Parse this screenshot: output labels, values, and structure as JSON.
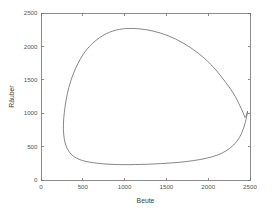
{
  "figure": {
    "background_color": "#ffffff",
    "axes_color": "#6f6f6f",
    "tick_label_color": "#555555",
    "axis_title_color": "#404040",
    "curve_color": "#5e5e5e"
  },
  "chart_data": {
    "type": "line",
    "title": "",
    "subtitle": "",
    "xlabel": "Beute",
    "ylabel": "Räuber",
    "xlim": [
      0,
      2500
    ],
    "ylim": [
      0,
      2500
    ],
    "xticks": [
      0,
      500,
      1000,
      1500,
      2000,
      2500
    ],
    "yticks": [
      0,
      500,
      1000,
      1500,
      2000,
      2500
    ],
    "xtick_labels": [
      "0",
      "500",
      "1000",
      "1500",
      "2000",
      "2500"
    ],
    "ytick_labels": [
      "0",
      "500",
      "1000",
      "1500",
      "2000",
      "2500"
    ],
    "grid": false,
    "legend": null,
    "legend_position": "none",
    "annotations": [],
    "series": [
      {
        "name": "Trajektorie",
        "color": "#5e5e5e",
        "linewidth": 0.75,
        "closed_orbit": true,
        "description": "Geschlossener Grenzzyklus im Phasenraum Beute-Räuber",
        "x": [
          2440,
          2380,
          2300,
          2180,
          2040,
          1880,
          1700,
          1520,
          1340,
          1180,
          1040,
          940,
          860,
          780,
          700,
          620,
          545,
          475,
          410,
          355,
          315,
          288,
          272,
          268,
          278,
          300,
          338,
          390,
          455,
          535,
          630,
          735,
          850,
          980,
          1120,
          1270,
          1430,
          1590,
          1750,
          1900,
          2040,
          2160,
          2260,
          2340,
          2400,
          2440,
          2462,
          2470,
          2466,
          2455,
          2440
        ],
        "y": [
          940,
          1110,
          1300,
          1510,
          1720,
          1900,
          2050,
          2160,
          2230,
          2262,
          2268,
          2255,
          2230,
          2190,
          2130,
          2050,
          1950,
          1820,
          1660,
          1480,
          1290,
          1100,
          920,
          760,
          620,
          510,
          420,
          355,
          310,
          278,
          258,
          243,
          234,
          230,
          231,
          236,
          245,
          258,
          278,
          306,
          345,
          400,
          475,
          575,
          700,
          845,
          960,
          1030,
          1000,
          965,
          940
        ],
        "extrema": {
          "x_min": 268,
          "x_max": 2470,
          "y_min": 230,
          "y_max": 2268,
          "peak_at_x": 1040
        }
      }
    ]
  }
}
